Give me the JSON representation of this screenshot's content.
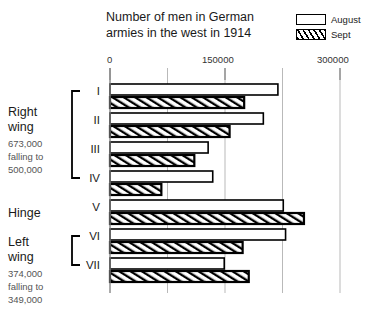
{
  "chart_data": {
    "type": "bar",
    "orientation": "horizontal",
    "title": "Number of men in German armies in the west in 1914",
    "title_lines": [
      "Number of men in German",
      "armies in the west in 1914"
    ],
    "xlabel": "",
    "ylabel": "",
    "xlim": [
      0,
      300000
    ],
    "xticks": [
      0,
      150000,
      300000
    ],
    "xtick_labels": [
      "0",
      "150000",
      "300000"
    ],
    "gridlines": [
      0,
      75000,
      150000,
      225000,
      300000
    ],
    "grid": true,
    "legend_position": "top-right",
    "categories": [
      "I",
      "II",
      "III",
      "IV",
      "V",
      "VI",
      "VII"
    ],
    "series": [
      {
        "name": "August",
        "values": [
          219000,
          200000,
          128000,
          134000,
          226000,
          229000,
          149000
        ]
      },
      {
        "name": "Sept",
        "values": [
          175000,
          156000,
          110000,
          67000,
          253000,
          173000,
          181000
        ]
      }
    ]
  },
  "legend": {
    "items": [
      {
        "label": "August",
        "pattern": "solid"
      },
      {
        "label": "Sept",
        "pattern": "hatched"
      }
    ]
  },
  "groups": [
    {
      "name_lines": [
        "Right",
        "wing"
      ],
      "sub_lines": [
        "673,000",
        "falling to",
        "500,000"
      ],
      "armies": [
        "I",
        "II",
        "III",
        "IV"
      ],
      "bracket": true
    },
    {
      "name_lines": [
        "Hinge"
      ],
      "sub_lines": [],
      "armies": [
        "V"
      ],
      "bracket": false
    },
    {
      "name_lines": [
        "Left",
        "wing"
      ],
      "sub_lines": [
        "374,000",
        "falling to",
        "349,000"
      ],
      "armies": [
        "VI",
        "VII"
      ],
      "bracket": true
    }
  ]
}
